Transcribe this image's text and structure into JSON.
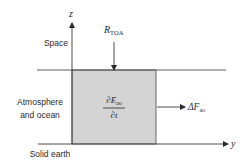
{
  "diagram": {
    "axes": {
      "vertical_label": "z",
      "horizontal_label": "y"
    },
    "regions": {
      "space": "Space",
      "atmosphere_line1": "Atmosphere",
      "atmosphere_line2": "and ocean",
      "solid_earth": "Solid earth"
    },
    "toa_flux": {
      "symbol": "R",
      "subscript": "TOA"
    },
    "storage_term": {
      "numerator_symbol": "∂E",
      "numerator_subscript": "ao",
      "denominator": "∂t"
    },
    "transport_flux": {
      "symbol": "ΔF",
      "subscript": "ao"
    },
    "colors": {
      "box_fill": "#d4d4d4",
      "line": "#3a3a3a",
      "text": "#2a2a2a"
    }
  }
}
